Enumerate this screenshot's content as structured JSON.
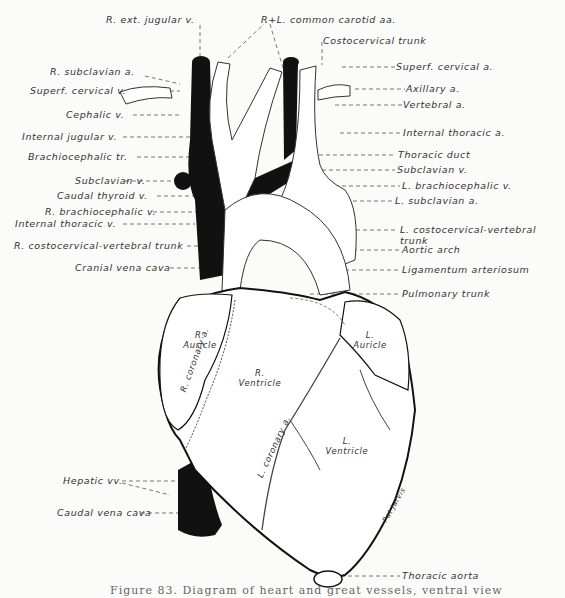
{
  "figure": {
    "caption": "Figure 83. Diagram of heart and great vessels, ventral view",
    "signature": "Pat Jarvis",
    "colors": {
      "ink": "#111111",
      "paper": "#fbfbf9",
      "label": "#333333"
    }
  },
  "labels_left": [
    {
      "id": "r-ext-jugular-v",
      "text": "R. ext. jugular v."
    },
    {
      "id": "r-subclavian-a",
      "text": "R. subclavian a."
    },
    {
      "id": "superf-cervical-v",
      "text": "Superf. cervical v."
    },
    {
      "id": "cephalic-v",
      "text": "Cephalic v."
    },
    {
      "id": "internal-jugular-v",
      "text": "Internal jugular v."
    },
    {
      "id": "brachiocephalic-tr",
      "text": "Brachiocephalic tr."
    },
    {
      "id": "subclavian-v-r",
      "text": "Subclavian v."
    },
    {
      "id": "caudal-thyroid-v",
      "text": "Caudal thyroid v."
    },
    {
      "id": "r-brachiocephalic-v",
      "text": "R. brachiocephalic v."
    },
    {
      "id": "internal-thoracic-v",
      "text": "Internal thoracic v."
    },
    {
      "id": "r-costocervical-vertebral-trunk",
      "text": "R. costocervical-vertebral trunk"
    },
    {
      "id": "cranial-vena-cava",
      "text": "Cranial vena cava"
    },
    {
      "id": "hepatic-vv",
      "text": "Hepatic vv."
    },
    {
      "id": "caudal-vena-cava",
      "text": "Caudal vena cava"
    }
  ],
  "labels_right": [
    {
      "id": "r-l-common-carotid-aa",
      "text": "R+L. common carotid aa."
    },
    {
      "id": "costocervical-trunk",
      "text": "Costocervical trunk"
    },
    {
      "id": "superf-cervical-a",
      "text": "Superf. cervical a."
    },
    {
      "id": "axillary-a",
      "text": "Axillary a."
    },
    {
      "id": "vertebral-a",
      "text": "Vertebral a."
    },
    {
      "id": "internal-thoracic-a",
      "text": "Internal thoracic a."
    },
    {
      "id": "thoracic-duct",
      "text": "Thoracic duct"
    },
    {
      "id": "subclavian-v-l",
      "text": "Subclavian v."
    },
    {
      "id": "l-brachiocephalic-v",
      "text": "L. brachiocephalic v."
    },
    {
      "id": "l-subclavian-a",
      "text": "L. subclavian a."
    },
    {
      "id": "l-costocervical-vertebral-trunk",
      "text": "L. costocervical-vertebral trunk"
    },
    {
      "id": "aortic-arch",
      "text": "Aortic arch"
    },
    {
      "id": "ligamentum-arteriosum",
      "text": "Ligamentum arteriosum"
    },
    {
      "id": "pulmonary-trunk",
      "text": "Pulmonary trunk"
    },
    {
      "id": "thoracic-aorta",
      "text": "Thoracic aorta"
    }
  ],
  "labels_inner": {
    "r_auricle": "R. Auricle",
    "l_auricle": "L. Auricle",
    "r_ventricle": "R. Ventricle",
    "l_ventricle": "L. Ventricle",
    "r_coronary": "R. coronary a.",
    "l_coronary": "L. coronary a."
  }
}
